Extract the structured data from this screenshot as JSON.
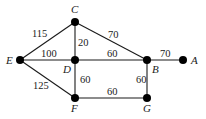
{
  "graph": {
    "nodes": [
      {
        "id": "A",
        "label": "A",
        "x": 183,
        "y": 60,
        "lx": 191,
        "ly": 64
      },
      {
        "id": "B",
        "label": "B",
        "x": 147,
        "y": 60,
        "lx": 152,
        "ly": 73
      },
      {
        "id": "C",
        "label": "C",
        "x": 75,
        "y": 22,
        "lx": 71,
        "ly": 13
      },
      {
        "id": "D",
        "label": "D",
        "x": 75,
        "y": 60,
        "lx": 63,
        "ly": 73
      },
      {
        "id": "E",
        "label": "E",
        "x": 20,
        "y": 60,
        "lx": 6,
        "ly": 64
      },
      {
        "id": "F",
        "label": "F",
        "x": 75,
        "y": 98,
        "lx": 71,
        "ly": 112
      },
      {
        "id": "G",
        "label": "G",
        "x": 147,
        "y": 98,
        "lx": 143,
        "ly": 112
      }
    ],
    "edges": [
      {
        "from": "E",
        "to": "C",
        "weight": "115",
        "wx": 32,
        "wy": 37
      },
      {
        "from": "C",
        "to": "D",
        "weight": "20",
        "wx": 78,
        "wy": 46
      },
      {
        "from": "C",
        "to": "B",
        "weight": "70",
        "wx": 108,
        "wy": 38
      },
      {
        "from": "E",
        "to": "D",
        "weight": "100",
        "wx": 41,
        "wy": 57
      },
      {
        "from": "D",
        "to": "B",
        "weight": "60",
        "wx": 107,
        "wy": 57
      },
      {
        "from": "B",
        "to": "A",
        "weight": "70",
        "wx": 160,
        "wy": 57
      },
      {
        "from": "E",
        "to": "F",
        "weight": "125",
        "wx": 33,
        "wy": 89
      },
      {
        "from": "D",
        "to": "F",
        "weight": "60",
        "wx": 80,
        "wy": 83
      },
      {
        "from": "B",
        "to": "G",
        "weight": "60",
        "wx": 136,
        "wy": 83
      },
      {
        "from": "F",
        "to": "G",
        "weight": "60",
        "wx": 107,
        "wy": 95
      }
    ]
  }
}
